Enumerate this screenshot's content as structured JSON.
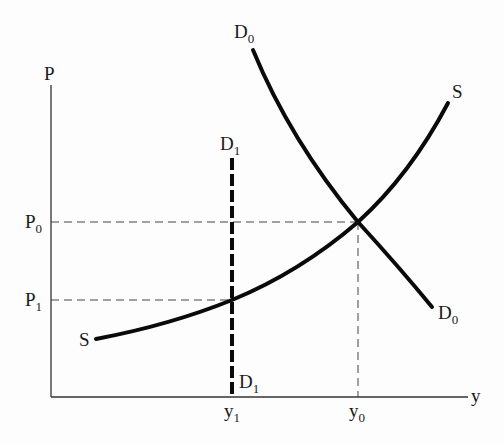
{
  "diagram": {
    "type": "supply-demand",
    "axes": {
      "y_axis_label": "P",
      "x_axis_label": "y"
    },
    "price_ticks": [
      {
        "base": "P",
        "sub": "0"
      },
      {
        "base": "P",
        "sub": "1"
      }
    ],
    "quantity_ticks": [
      {
        "base": "y",
        "sub": "1"
      },
      {
        "base": "y",
        "sub": "0"
      }
    ],
    "curves": {
      "supply": {
        "label_start": "S",
        "label_end": "S"
      },
      "demand_0": {
        "label_top": {
          "base": "D",
          "sub": "0"
        },
        "label_bottom": {
          "base": "D",
          "sub": "0"
        }
      },
      "demand_1": {
        "label_top": {
          "base": "D",
          "sub": "1"
        },
        "label_bottom": {
          "base": "D",
          "sub": "1"
        },
        "style": "dashed-vertical"
      }
    },
    "colors": {
      "curve": "#0a0a0a",
      "axis": "#333333",
      "guide": "#444444",
      "background": "#fdfdfd"
    }
  }
}
